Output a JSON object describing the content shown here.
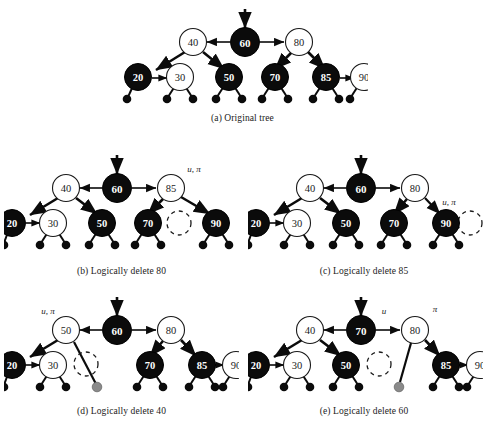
{
  "figure": {
    "colors": {
      "black_node_fill": "#0b0b0b",
      "black_node_stroke": "#000000",
      "black_node_text": "#ffffff",
      "red_node_fill": "#ffffff",
      "red_node_stroke": "#1a1a1a",
      "red_node_text": "#1a1a1a",
      "leaf_fill": "#0b0b0b",
      "ghost_leaf_fill": "#8a8a8a",
      "edge": "#0b0b0b",
      "dashed_circle": "#1a1a1a",
      "background": "#ffffff"
    },
    "legend_notes": {
      "filled_circle": "black node",
      "hollow_circle": "red node",
      "dashed_circle": "logically deleted node",
      "small_filled_circle": "nil leaf",
      "gray_circle": "detached nil leaf"
    },
    "panels": [
      {
        "id": "a",
        "caption": "(a) Original tree",
        "root_arrow": true,
        "nodes": [
          {
            "key": "60",
            "color": "black"
          },
          {
            "key": "40",
            "color": "red"
          },
          {
            "key": "80",
            "color": "red"
          },
          {
            "key": "20",
            "color": "black"
          },
          {
            "key": "30",
            "color": "red"
          },
          {
            "key": "50",
            "color": "black"
          },
          {
            "key": "70",
            "color": "black"
          },
          {
            "key": "85",
            "color": "black"
          },
          {
            "key": "90",
            "color": "red"
          }
        ],
        "annotations": [],
        "ghost": null
      },
      {
        "id": "b",
        "caption": "(b) Logically delete 80",
        "root_arrow": true,
        "nodes": [
          {
            "key": "60",
            "color": "black"
          },
          {
            "key": "40",
            "color": "red"
          },
          {
            "key": "85",
            "color": "red"
          },
          {
            "key": "20",
            "color": "black"
          },
          {
            "key": "30",
            "color": "red"
          },
          {
            "key": "50",
            "color": "black"
          },
          {
            "key": "70",
            "color": "black"
          },
          {
            "key": "90",
            "color": "black"
          }
        ],
        "annotations": [
          {
            "text": "u, π",
            "attached_to": "85"
          }
        ],
        "ghost": {
          "type": "dashed-circle",
          "label": ""
        }
      },
      {
        "id": "c",
        "caption": "(c) Logically delete 85",
        "root_arrow": true,
        "nodes": [
          {
            "key": "60",
            "color": "black"
          },
          {
            "key": "40",
            "color": "red"
          },
          {
            "key": "80",
            "color": "red"
          },
          {
            "key": "20",
            "color": "black"
          },
          {
            "key": "30",
            "color": "red"
          },
          {
            "key": "50",
            "color": "black"
          },
          {
            "key": "70",
            "color": "black"
          },
          {
            "key": "90",
            "color": "black"
          }
        ],
        "annotations": [
          {
            "text": "u, π",
            "attached_to": "90"
          }
        ],
        "ghost": {
          "type": "dashed-circle",
          "label": ""
        }
      },
      {
        "id": "d",
        "caption": "(d) Logically delete 40",
        "root_arrow": true,
        "nodes": [
          {
            "key": "60",
            "color": "black"
          },
          {
            "key": "50",
            "color": "red"
          },
          {
            "key": "80",
            "color": "red"
          },
          {
            "key": "20",
            "color": "black"
          },
          {
            "key": "30",
            "color": "red"
          },
          {
            "key": "70",
            "color": "black"
          },
          {
            "key": "85",
            "color": "black"
          },
          {
            "key": "90",
            "color": "red"
          }
        ],
        "annotations": [
          {
            "text": "u, π",
            "attached_to": "50"
          }
        ],
        "ghost": {
          "type": "dashed-circle",
          "label": "",
          "gray_leaf": true
        }
      },
      {
        "id": "e",
        "caption": "(e) Logically delete 60",
        "root_arrow": true,
        "nodes": [
          {
            "key": "70",
            "color": "black"
          },
          {
            "key": "40",
            "color": "red"
          },
          {
            "key": "80",
            "color": "red"
          },
          {
            "key": "20",
            "color": "black"
          },
          {
            "key": "30",
            "color": "red"
          },
          {
            "key": "50",
            "color": "black"
          },
          {
            "key": "85",
            "color": "black"
          },
          {
            "key": "90",
            "color": "red"
          }
        ],
        "annotations": [
          {
            "text": "u",
            "attached_to": "70"
          },
          {
            "text": "π",
            "attached_to": "80"
          }
        ],
        "ghost": {
          "type": "dashed-circle",
          "label": "",
          "gray_leaf": true
        }
      }
    ]
  },
  "labels": {
    "n60": "60",
    "n40": "40",
    "n80": "80",
    "n20": "20",
    "n30": "30",
    "n50": "50",
    "n70": "70",
    "n85": "85",
    "n90": "90",
    "u_pi": "u, π",
    "u": "u",
    "pi": "π"
  },
  "captions": {
    "a": "(a) Original tree",
    "b": "(b) Logically delete 80",
    "c": "(c) Logically delete 85",
    "d": "(d) Logically delete 40",
    "e": "(e) Logically delete 60"
  }
}
